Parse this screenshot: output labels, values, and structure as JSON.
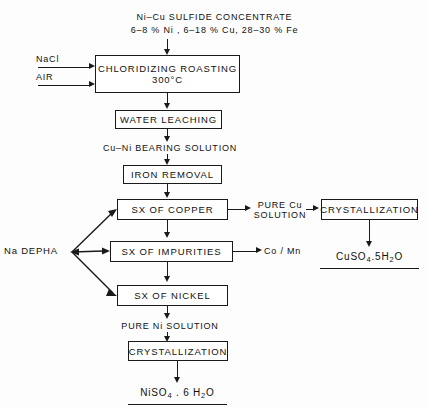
{
  "diagram": {
    "title_lines": [
      "Ni–Cu SULFIDE  CONCENTRATE",
      "6–8 % Ni , 6–18 % Cu, 28–30 % Fe"
    ],
    "feed_inputs": [
      {
        "name": "nacl",
        "label": "NaCl"
      },
      {
        "name": "air",
        "label": "AIR"
      }
    ],
    "reagent": {
      "label": "Na DEPHA"
    },
    "boxes": [
      {
        "id": "chloridizing-roasting",
        "line1": "CHLORIDIZING  ROASTING",
        "line2": "300°C"
      },
      {
        "id": "water-leaching",
        "line1": "WATER  LEACHING"
      },
      {
        "id": "iron-removal",
        "line1": "IRON  REMOVAL"
      },
      {
        "id": "sx-of-copper",
        "line1": "SX  OF  COPPER"
      },
      {
        "id": "sx-of-impurities",
        "line1": "SX  OF  IMPURITIES"
      },
      {
        "id": "sx-of-nickel",
        "line1": "SX  OF  NICKEL"
      },
      {
        "id": "crystallization-cu",
        "line1": "CRYSTALLIZATION"
      },
      {
        "id": "crystallization-ni",
        "line1": "CRYSTALLIZATION"
      }
    ],
    "stream_labels": [
      {
        "id": "cu-ni-bearing-solution",
        "text": "Cu–Ni  BEARING  SOLUTION"
      },
      {
        "id": "pure-cu-solution-line1",
        "text": "PURE  Cu"
      },
      {
        "id": "pure-cu-solution-line2",
        "text": "SOLUTION"
      },
      {
        "id": "co-mn-byproduct",
        "text": "Co / Mn"
      },
      {
        "id": "pure-ni-solution",
        "text": "PURE Ni SOLUTION"
      }
    ],
    "products": [
      {
        "id": "copper-sulfate-product",
        "formula_prefix": "CuSO",
        "sub1": "4",
        "mid": ".5H",
        "sub2": "2",
        "suffix": "O"
      },
      {
        "id": "nickel-sulfate-product",
        "formula_prefix": "NiSO",
        "sub1": "4",
        "mid": " . 6 H",
        "sub2": "2",
        "suffix": "O"
      }
    ]
  }
}
